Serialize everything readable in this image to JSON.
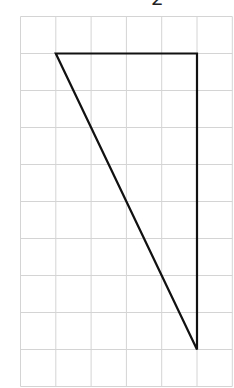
{
  "label": {
    "text": "2"
  },
  "grid": {
    "columns": 6,
    "rows": 10,
    "line_color": "#d4d4d4"
  },
  "triangle": {
    "stroke_color": "#111111",
    "vertices_in_grid_units": [
      [
        1,
        1
      ],
      [
        5,
        1
      ],
      [
        5,
        9
      ]
    ]
  }
}
